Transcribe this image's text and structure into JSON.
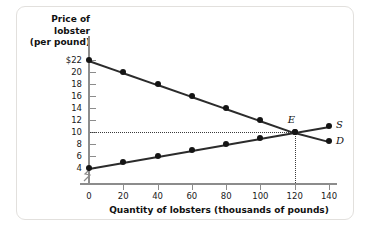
{
  "chart_data": {
    "type": "line",
    "title": "",
    "xlabel": "Quantity of lobsters (thousands of pounds)",
    "ylabel": "Price of lobster (per pound)",
    "ylabel_lines": [
      "Price of",
      "lobster",
      "(per pound)"
    ],
    "xlim": [
      0,
      140
    ],
    "ylim": [
      4,
      22
    ],
    "xticks": [
      0,
      20,
      40,
      60,
      80,
      100,
      120,
      140
    ],
    "yticks": [
      4,
      6,
      8,
      10,
      12,
      14,
      16,
      18,
      20,
      22
    ],
    "ytick_labels": [
      "4",
      "6",
      "8",
      "10",
      "12",
      "14",
      "16",
      "18",
      "20",
      "$22"
    ],
    "xtick_labels": [
      "0",
      "20",
      "40",
      "60",
      "80",
      "100",
      "120",
      "140"
    ],
    "grid": false,
    "axis_break_y": true,
    "legend": "inline-curve-labels",
    "series": [
      {
        "name": "D",
        "label": "D",
        "description": "Demand curve",
        "x": [
          0,
          20,
          40,
          60,
          80,
          100,
          120,
          140
        ],
        "values": [
          22,
          20,
          18,
          16,
          14,
          12,
          10,
          8.5
        ]
      },
      {
        "name": "S",
        "label": "S",
        "description": "Supply curve",
        "x": [
          0,
          20,
          40,
          60,
          80,
          100,
          120,
          140
        ],
        "values": [
          4,
          5,
          6,
          7,
          8,
          9,
          10,
          11
        ]
      }
    ],
    "annotations": [
      {
        "name": "equilibrium",
        "label": "E",
        "x": 120,
        "y": 10,
        "guides": [
          "horizontal-dotted-to-price-axis",
          "vertical-dotted-to-quantity-axis"
        ]
      }
    ],
    "colors": {
      "curve": "#2b2b2b",
      "point": "#141414",
      "axis": "#8c8c8c",
      "guide": "#3a3a3a",
      "background": "#ffffff",
      "card_border": "#e2e0dd"
    }
  }
}
